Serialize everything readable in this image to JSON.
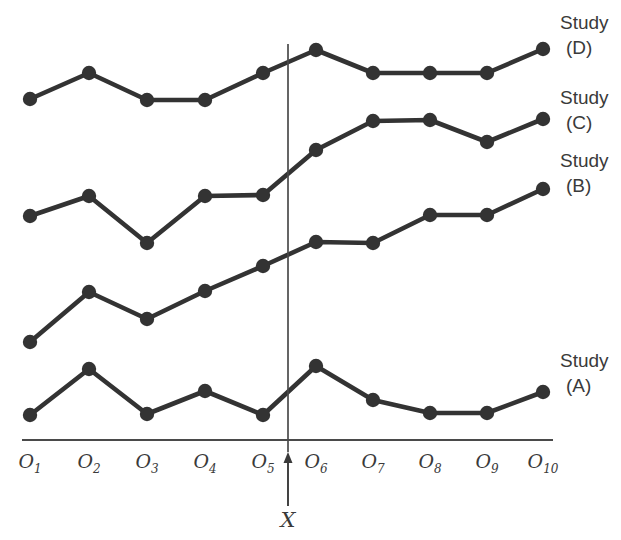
{
  "chart_data": {
    "type": "line",
    "title": "",
    "xlabel": "",
    "ylabel": "",
    "grid": false,
    "legend_position": "right-inline",
    "categories": [
      "O1",
      "O2",
      "O3",
      "O4",
      "O5",
      "O6",
      "O7",
      "O8",
      "O9",
      "O10"
    ],
    "tick_labels": [
      {
        "base": "O",
        "sub": "1"
      },
      {
        "base": "O",
        "sub": "2"
      },
      {
        "base": "O",
        "sub": "3"
      },
      {
        "base": "O",
        "sub": "4"
      },
      {
        "base": "O",
        "sub": "5"
      },
      {
        "base": "O",
        "sub": "6"
      },
      {
        "base": "O",
        "sub": "7"
      },
      {
        "base": "O",
        "sub": "8"
      },
      {
        "base": "O",
        "sub": "9"
      },
      {
        "base": "O",
        "sub": "10"
      }
    ],
    "annotations": [
      {
        "name": "intervention-marker",
        "label": "X",
        "between": [
          "O5",
          "O6"
        ],
        "style": "vertical-line-with-up-arrow"
      }
    ],
    "series": [
      {
        "name": "Study (D)",
        "label_top": "Study",
        "label_bottom": "(D)",
        "color": "#333333",
        "values": [
          3.6,
          5.3,
          3.5,
          3.5,
          5.3,
          6.9,
          5.3,
          5.3,
          5.3,
          6.9
        ]
      },
      {
        "name": "Study (C)",
        "label_top": "Study",
        "label_bottom": "(C)",
        "color": "#333333",
        "values": [
          -4.1,
          -2.7,
          -5.8,
          -2.8,
          -2.7,
          -0.6,
          1.2,
          1.3,
          -0.2,
          1.4
        ]
      },
      {
        "name": "Study (B)",
        "label_top": "Study",
        "label_bottom": "(B)",
        "color": "#333333",
        "values": [
          -12.4,
          -9.1,
          -10.8,
          -8.9,
          -7.4,
          -5.8,
          -5.9,
          -4.0,
          -4.0,
          -2.3
        ]
      },
      {
        "name": "Study (A)",
        "label_top": "Study",
        "label_bottom": "(A)",
        "color": "#333333",
        "values": [
          -17.2,
          -14.2,
          -17.1,
          -15.5,
          -17.2,
          -14.0,
          -16.3,
          -17.1,
          -17.1,
          -15.7
        ]
      }
    ],
    "pixel_geometry": {
      "note": "pixel coordinates used to draw the figure",
      "x_positions": [
        30,
        89,
        147,
        205,
        263,
        316,
        373,
        430,
        487,
        543
      ],
      "axis_y": 440,
      "axis_x_start": 22,
      "axis_x_end": 553,
      "vline_x": 288,
      "vline_y_top": 44,
      "vline_y_bottom": 452,
      "arrow_y_top": 452,
      "arrow_y_bottom": 506,
      "marker_radius": 7.2,
      "series_pixel_y": {
        "Study (D)": [
          99,
          73,
          100,
          100,
          73,
          50,
          73,
          73,
          73,
          49
        ],
        "Study (C)": [
          216,
          196,
          243,
          196,
          195,
          150,
          121,
          120,
          142,
          119
        ],
        "Study (B)": [
          342,
          292,
          319,
          291,
          266,
          242,
          243,
          215,
          215,
          189
        ],
        "Study (A)": [
          415,
          369,
          414,
          391,
          415,
          366,
          400,
          413,
          413,
          392
        ]
      },
      "label_anchors": [
        {
          "series": "Study (D)",
          "x": 560,
          "y": 10
        },
        {
          "series": "Study (C)",
          "x": 560,
          "y": 85
        },
        {
          "series": "Study (B)",
          "x": 560,
          "y": 148
        },
        {
          "series": "Study (A)",
          "x": 560,
          "y": 348
        }
      ],
      "tick_label_y": 450,
      "x_marker_label_xy": [
        288,
        508
      ]
    }
  }
}
